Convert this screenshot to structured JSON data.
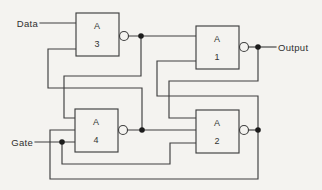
{
  "figure": {
    "kind": "logic-circuit-diagram",
    "colors": {
      "background": "#f4f3f0",
      "line": "#3f3f3f",
      "junction_dot": "#1c1c1c"
    },
    "labels": {
      "data": "Data",
      "gate": "Gate",
      "output": "Output"
    },
    "gates": [
      {
        "id": "A3",
        "letter": "A",
        "number": "3",
        "position": "top-left",
        "inputs": [
          "Data",
          "gate A4 output"
        ],
        "output_to": [
          "gate A1 top input",
          "gate A4 top input"
        ]
      },
      {
        "id": "A1",
        "letter": "A",
        "number": "1",
        "position": "top-right",
        "inputs": [
          "gate A3 output",
          "gate A2 output"
        ],
        "output_to": [
          "Output",
          "gate A2 top input"
        ]
      },
      {
        "id": "A4",
        "letter": "A",
        "number": "4",
        "position": "bottom-left",
        "inputs": [
          "gate A3 output",
          "gate A2 output",
          "Gate"
        ],
        "output_to": [
          "gate A3 lower input",
          "gate A2 middle input"
        ]
      },
      {
        "id": "A2",
        "letter": "A",
        "number": "2",
        "position": "bottom-right",
        "inputs": [
          "gate A1 output",
          "gate A4 output",
          "Gate"
        ],
        "output_to": [
          "gate A1 lower input",
          "gate A4 middle input"
        ]
      }
    ],
    "junctions": [
      "A3 output node",
      "A1 output node at Output",
      "Gate input node",
      "A4 output node",
      "A2 output node"
    ]
  }
}
